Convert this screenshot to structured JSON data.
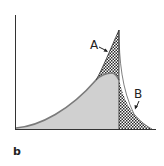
{
  "figure": {
    "panel_label": "b",
    "region_labels": {
      "a": "A",
      "b": "B"
    },
    "colors": {
      "axis": "#333333",
      "curve_fill": "#d0d0d0",
      "curve_stroke": "#7a7a7a",
      "hatch_dark": "#2a2a2a",
      "hatch_light": "#ffffff",
      "background": "#ffffff"
    },
    "regions": [
      {
        "id": "A",
        "description": "cross-hatched spike region above the smooth curve, left of the vertical cutoff"
      },
      {
        "id": "B",
        "description": "cross-hatched tail region right of the vertical cutoff"
      },
      {
        "id": "base",
        "description": "light gray area under the smooth curve"
      }
    ]
  }
}
